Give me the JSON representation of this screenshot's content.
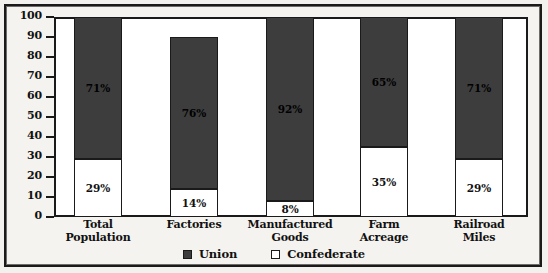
{
  "chart_data": {
    "type": "bar",
    "subtype": "stacked-bar-100",
    "title": "",
    "xlabel": "",
    "ylabel": "",
    "ylim": [
      0,
      100
    ],
    "y_ticks": [
      0,
      10,
      20,
      30,
      40,
      50,
      60,
      70,
      80,
      90,
      100
    ],
    "grid": false,
    "legend_position": "bottom-center",
    "categories": [
      "Total Population",
      "Factories",
      "Manufactured Goods",
      "Farm Acreage",
      "Railroad Miles"
    ],
    "category_lines": [
      [
        "Total",
        "Population"
      ],
      [
        "Factories",
        ""
      ],
      [
        "Manufactured",
        "Goods"
      ],
      [
        "Farm",
        "Acreage"
      ],
      [
        "Railroad",
        "Miles"
      ]
    ],
    "series": [
      {
        "name": "Union",
        "color": "#3d3d3d",
        "values": [
          71,
          76,
          92,
          65,
          71
        ],
        "labels": [
          "71%",
          "76%",
          "92%",
          "65%",
          "71%"
        ]
      },
      {
        "name": "Confederate",
        "color": "#ffffff",
        "values": [
          29,
          14,
          8,
          35,
          29
        ],
        "labels": [
          "29%",
          "14%",
          "8%",
          "35%",
          "29%"
        ]
      }
    ]
  },
  "legend": {
    "entries": [
      {
        "label": "Union",
        "swatch": "filled-dark-square"
      },
      {
        "label": "Confederate",
        "swatch": "hollow-white-square"
      }
    ]
  },
  "colors": {
    "union_fill": "#3d3d3d",
    "confederate_fill": "#ffffff",
    "outline": "#1a1a1a",
    "page_background": "#f2f1ed",
    "plot_background": "#ffffff"
  }
}
